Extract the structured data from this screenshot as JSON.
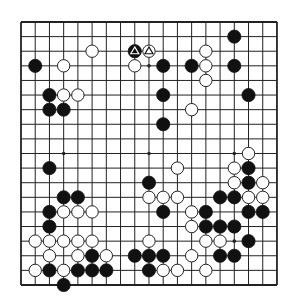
{
  "board": {
    "size": 19,
    "origin_x": 21,
    "origin_y": 22,
    "spacing_x": 14.22,
    "spacing_y": 14.61,
    "stone_radius": 6.6,
    "colors": {
      "background": "#ffffff",
      "line": "#222222",
      "black_stone": "#111111",
      "white_stone": "#ffffff",
      "white_stone_edge": "#222222"
    },
    "star_points": [
      [
        3,
        3
      ],
      [
        9,
        3
      ],
      [
        15,
        3
      ],
      [
        3,
        9
      ],
      [
        9,
        9
      ],
      [
        15,
        9
      ],
      [
        3,
        15
      ],
      [
        9,
        15
      ],
      [
        15,
        15
      ]
    ],
    "black_stones": [
      [
        1,
        3
      ],
      [
        8,
        2
      ],
      [
        10,
        3
      ],
      [
        12,
        3
      ],
      [
        15,
        1
      ],
      [
        15,
        3
      ],
      [
        2,
        5
      ],
      [
        10,
        5
      ],
      [
        16,
        5
      ],
      [
        2,
        6
      ],
      [
        3,
        6
      ],
      [
        10,
        7
      ],
      [
        2,
        10
      ],
      [
        9,
        11
      ],
      [
        16,
        10
      ],
      [
        16,
        11
      ],
      [
        3,
        12
      ],
      [
        4,
        12
      ],
      [
        14,
        12
      ],
      [
        15,
        12
      ],
      [
        2,
        13
      ],
      [
        10,
        13
      ],
      [
        13,
        13
      ],
      [
        16,
        13
      ],
      [
        17,
        13
      ],
      [
        2,
        14
      ],
      [
        13,
        14
      ],
      [
        14,
        14
      ],
      [
        15,
        14
      ],
      [
        16,
        15
      ],
      [
        5,
        16
      ],
      [
        8,
        16
      ],
      [
        9,
        16
      ],
      [
        10,
        16
      ],
      [
        14,
        16
      ],
      [
        15,
        16
      ],
      [
        2,
        17
      ],
      [
        4,
        17
      ],
      [
        5,
        17
      ],
      [
        6,
        17
      ],
      [
        9,
        17
      ],
      [
        3,
        18
      ]
    ],
    "white_stones": [
      [
        5,
        2
      ],
      [
        9,
        2
      ],
      [
        13,
        2
      ],
      [
        3,
        3
      ],
      [
        8,
        3
      ],
      [
        13,
        3
      ],
      [
        13,
        4
      ],
      [
        3,
        5
      ],
      [
        4,
        5
      ],
      [
        12,
        6
      ],
      [
        16,
        9
      ],
      [
        11,
        10
      ],
      [
        15,
        10
      ],
      [
        15,
        11
      ],
      [
        17,
        11
      ],
      [
        9,
        12
      ],
      [
        10,
        12
      ],
      [
        11,
        12
      ],
      [
        16,
        12
      ],
      [
        17,
        12
      ],
      [
        3,
        13
      ],
      [
        4,
        13
      ],
      [
        5,
        13
      ],
      [
        12,
        13
      ],
      [
        12,
        14
      ],
      [
        1,
        15
      ],
      [
        2,
        15
      ],
      [
        3,
        15
      ],
      [
        4,
        15
      ],
      [
        5,
        15
      ],
      [
        9,
        15
      ],
      [
        13,
        15
      ],
      [
        14,
        15
      ],
      [
        2,
        16
      ],
      [
        4,
        16
      ],
      [
        6,
        16
      ],
      [
        12,
        16
      ],
      [
        1,
        17
      ],
      [
        3,
        17
      ],
      [
        10,
        17
      ],
      [
        11,
        17
      ],
      [
        13,
        17
      ]
    ],
    "marked_stones": [
      {
        "col": 8,
        "row": 2,
        "color": "black",
        "mark": "triangle-icon"
      },
      {
        "col": 9,
        "row": 2,
        "color": "white",
        "mark": "triangle-icon"
      }
    ]
  }
}
